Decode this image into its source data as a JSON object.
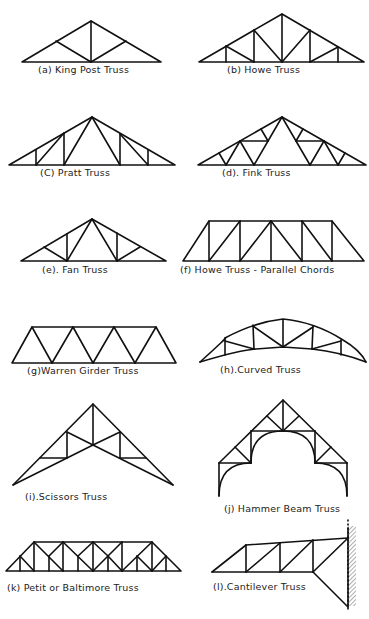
{
  "ink_color": "#111111",
  "trusses": [
    {
      "id": "a",
      "label": "(a) King Post Truss"
    },
    {
      "id": "b",
      "label": "(b) Howe Truss"
    },
    {
      "id": "c",
      "label": "(C) Pratt Truss"
    },
    {
      "id": "d",
      "label": "(d). Fink Truss"
    },
    {
      "id": "e",
      "label": "(e). Fan Truss"
    },
    {
      "id": "f",
      "label": "(f) Howe Truss - Parallel Chords"
    },
    {
      "id": "g",
      "label": "(g)Warren Girder Truss"
    },
    {
      "id": "h",
      "label": "(h).Curved Truss"
    },
    {
      "id": "i",
      "label": "(i).Scissors Truss"
    },
    {
      "id": "j",
      "label": "(j) Hammer Beam Truss"
    },
    {
      "id": "k",
      "label": "(k) Petit or Baltimore Truss"
    },
    {
      "id": "l",
      "label": "(l).Cantilever Truss"
    }
  ]
}
